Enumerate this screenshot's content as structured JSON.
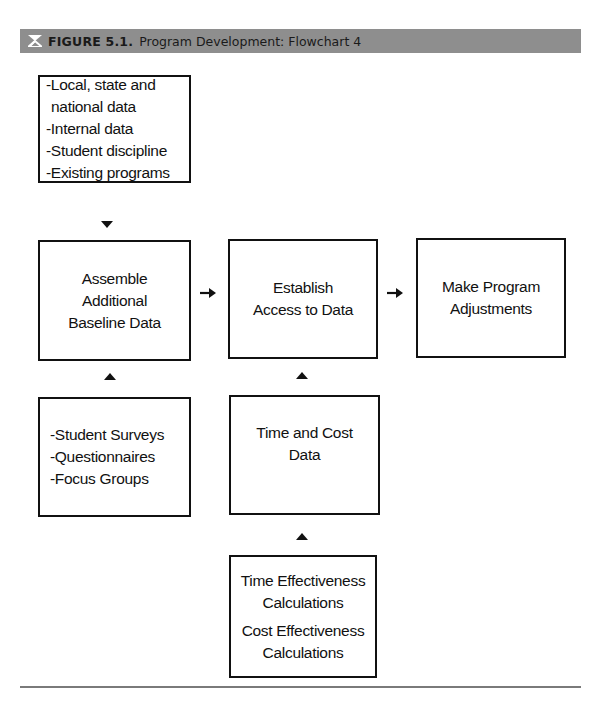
{
  "figure": {
    "logo_icon": "figure-logo-icon",
    "label": "FIGURE 5.1.",
    "title": "Program Development: Flowchart 4",
    "header_color": "#8e8e8e"
  },
  "nodes": {
    "sources": {
      "lines": [
        "-Local, state and",
        "national data",
        "-Internal data",
        "-Student discipline",
        "-Existing programs"
      ]
    },
    "assemble": {
      "lines": [
        "Assemble",
        "Additional",
        "Baseline Data"
      ]
    },
    "establish": {
      "lines": [
        "Establish",
        "Access to Data"
      ]
    },
    "adjust": {
      "lines": [
        "Make Program",
        "Adjustments"
      ]
    },
    "surveys": {
      "lines": [
        "-Student Surveys",
        "-Questionnaires",
        "-Focus Groups"
      ]
    },
    "time_cost": {
      "lines": [
        "Time and Cost",
        "Data"
      ]
    },
    "calculations": {
      "lines": [
        "Time Effectiveness",
        "Calculations",
        "Cost Effectiveness",
        "Calculations"
      ]
    }
  },
  "edges": [
    {
      "from": "sources",
      "to": "assemble",
      "direction": "down"
    },
    {
      "from": "surveys",
      "to": "assemble",
      "direction": "up"
    },
    {
      "from": "assemble",
      "to": "establish",
      "direction": "right"
    },
    {
      "from": "establish",
      "to": "adjust",
      "direction": "right"
    },
    {
      "from": "time_cost",
      "to": "establish",
      "direction": "up"
    },
    {
      "from": "calculations",
      "to": "time_cost",
      "direction": "up"
    }
  ]
}
